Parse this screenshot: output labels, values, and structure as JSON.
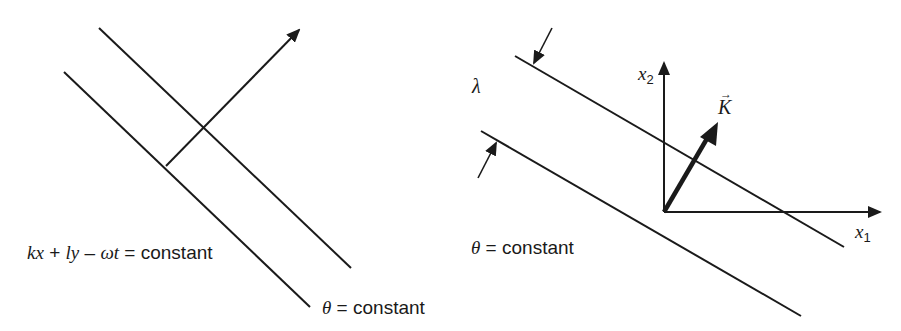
{
  "figure": {
    "left_panel": {
      "phase_label": {
        "k": "kx",
        "plus": " + ",
        "l": "ly",
        "minus": " – ",
        "omega": "ωt",
        "rest": " = constant"
      },
      "theta_label": {
        "theta": "θ",
        "rest": " = constant"
      }
    },
    "right_panel": {
      "lambda_label": "λ",
      "axis_x1": {
        "var": "x",
        "sub": "1"
      },
      "axis_x2": {
        "var": "x",
        "sub": "2"
      },
      "vector_label": "K",
      "vector_arrow": "→",
      "theta_label": {
        "theta": "θ",
        "rest": " = constant"
      }
    },
    "colors": {
      "ink": "#1a1a1a",
      "background": "#ffffff"
    }
  }
}
